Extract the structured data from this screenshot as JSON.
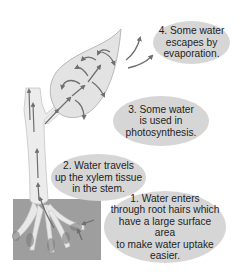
{
  "diagram": {
    "colors": {
      "background": "#ffffff",
      "bubble": "#d6d6d6",
      "leaf": "#e3e3e3",
      "stem": "#ececec",
      "soil": "#9e9e9e",
      "arrow": "#6f6f6f",
      "text": "#1e1e1e"
    },
    "labels": [
      {
        "step": 4,
        "text": "4. Some water\nescapes by\nevaporation."
      },
      {
        "step": 3,
        "text": "3. Some water\nis used in\nphotosynthesis."
      },
      {
        "step": 2,
        "text": "2. Water travels\nup the xylem tissue\nin the stem."
      },
      {
        "step": 1,
        "text": "1. Water enters\nthrough root hairs which\nhave a large surface area\nto make water uptake\neasier."
      }
    ],
    "parts": [
      "leaf",
      "stem",
      "roots",
      "soil",
      "root-hairs",
      "water-flow-arrows",
      "evaporation-arrows"
    ]
  }
}
